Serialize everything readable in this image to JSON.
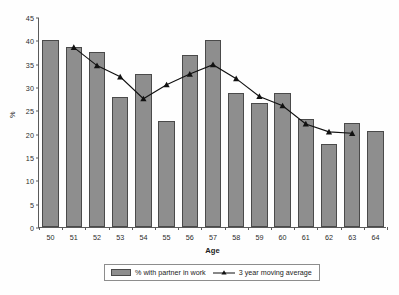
{
  "chart_data": {
    "type": "bar",
    "title": "",
    "xlabel": "Age",
    "ylabel": "%",
    "categories": [
      "50",
      "51",
      "52",
      "53",
      "54",
      "55",
      "56",
      "57",
      "58",
      "59",
      "60",
      "61",
      "62",
      "63",
      "64"
    ],
    "ylim": [
      0,
      45
    ],
    "yticks": [
      0,
      5,
      10,
      15,
      20,
      25,
      30,
      35,
      40,
      45
    ],
    "grid": false,
    "legend_position": "bottom-center",
    "series": [
      {
        "name": "% with partner in work",
        "type": "bar",
        "color": "#8e8e8e",
        "values": [
          40.0,
          38.6,
          37.4,
          27.9,
          32.7,
          22.7,
          36.9,
          40.0,
          28.8,
          26.5,
          28.8,
          23.2,
          17.8,
          22.2,
          20.5
        ]
      },
      {
        "name": "3 year moving average",
        "type": "line",
        "color": "#111111",
        "marker": "triangle",
        "values": [
          null,
          38.7,
          34.8,
          32.4,
          27.7,
          30.7,
          33.0,
          35.0,
          32.0,
          28.2,
          26.2,
          22.3,
          20.6,
          20.3,
          null
        ]
      }
    ]
  },
  "legend": {
    "bar_label": "% with partner in work",
    "line_label": "3 year moving average"
  },
  "icons": {
    "bar_swatch": "bar-swatch-icon",
    "line_swatch": "line-marker-swatch-icon"
  }
}
